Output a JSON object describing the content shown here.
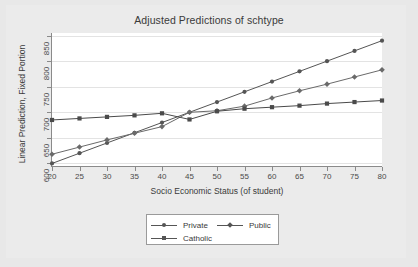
{
  "chart_data": {
    "type": "line",
    "title": "Adjusted Predictions of schtype",
    "xlabel": "Socio Economic Status (of student)",
    "ylabel": "Linear Prediction, Fixed Portion",
    "x": [
      20,
      25,
      30,
      35,
      40,
      45,
      50,
      55,
      60,
      65,
      70,
      75,
      80
    ],
    "xlim": [
      20,
      80
    ],
    "ylim": [
      595,
      855
    ],
    "xticks": [
      "20",
      "25",
      "30",
      "35",
      "40",
      "45",
      "50",
      "55",
      "60",
      "65",
      "70",
      "75",
      "80"
    ],
    "yticks": [
      "600",
      "650",
      "700",
      "750",
      "800",
      "850"
    ],
    "grid": "horizontal",
    "legend_position": "bottom",
    "series": [
      {
        "name": "Private",
        "marker": "circle",
        "color": "#555555",
        "values": [
          600,
          620,
          640,
          660,
          680,
          700,
          720,
          740,
          760,
          780,
          800,
          820,
          840
        ]
      },
      {
        "name": "Public",
        "marker": "diamond",
        "color": "#6a6a6a",
        "values": [
          618,
          632,
          646,
          659,
          672,
          700,
          703,
          712,
          728,
          742,
          755,
          769,
          783
        ]
      },
      {
        "name": "Catholic",
        "marker": "square",
        "color": "#4a4a4a",
        "values": [
          685,
          688,
          691,
          694,
          698,
          686,
          702,
          707,
          710,
          713,
          717,
          720,
          723
        ]
      }
    ]
  },
  "legend": {
    "items": [
      {
        "label": "Private",
        "marker": "circle"
      },
      {
        "label": "Public",
        "marker": "diamond"
      },
      {
        "label": "Catholic",
        "marker": "square"
      }
    ]
  }
}
